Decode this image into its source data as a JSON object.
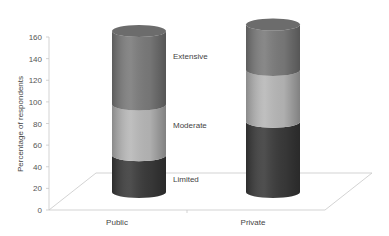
{
  "chart_data": {
    "type": "bar",
    "subtype": "stacked-3d-cylinder",
    "title": "",
    "xlabel": "",
    "ylabel": "Percentage of respondents",
    "ylim": [
      0,
      160
    ],
    "yticks": [
      0,
      20,
      40,
      60,
      80,
      100,
      120,
      140,
      160
    ],
    "grid": false,
    "legend": "inline labels next to first bar",
    "categories": [
      "Public",
      "Private"
    ],
    "series": [
      {
        "name": "Limited",
        "values": [
          34,
          65
        ],
        "color": "#3b3b3b"
      },
      {
        "name": "Moderate",
        "values": [
          47,
          48
        ],
        "color": "#b8b8b8"
      },
      {
        "name": "Extensive",
        "values": [
          68,
          42
        ],
        "color": "#7b7b7b"
      }
    ]
  },
  "labels": {
    "ylabel": "Percentage of respondents",
    "categories": [
      "Public",
      "Private"
    ],
    "segments": [
      "Limited",
      "Moderate",
      "Extensive"
    ]
  }
}
